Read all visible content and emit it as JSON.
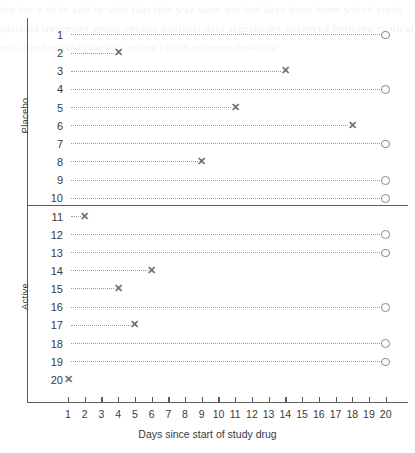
{
  "chart_data": {
    "type": "scatter",
    "title": "",
    "xlabel": "Days since start of study drug",
    "ylabel": "",
    "xlim": [
      0,
      21
    ],
    "xticks": [
      1,
      2,
      3,
      4,
      5,
      6,
      7,
      8,
      9,
      10,
      11,
      12,
      13,
      14,
      15,
      16,
      17,
      18,
      19,
      20
    ],
    "xtick_labels": [
      "1",
      "2",
      "3",
      "4",
      "5",
      "6",
      "7",
      "8",
      "9",
      "10",
      "11",
      "12",
      "13",
      "14",
      "15",
      "16",
      "17",
      "18",
      "19",
      "20"
    ],
    "grid": false,
    "legend": null,
    "groups": [
      {
        "name": "Placebo",
        "subjects": [
          {
            "id": "1",
            "start": 1,
            "end": 20,
            "marker": "circle",
            "has_line": true
          },
          {
            "id": "2",
            "start": 1,
            "end": 4,
            "marker": "cross",
            "has_line": true
          },
          {
            "id": "3",
            "start": 1,
            "end": 14,
            "marker": "cross",
            "has_line": true
          },
          {
            "id": "4",
            "start": 1,
            "end": 20,
            "marker": "circle",
            "has_line": true
          },
          {
            "id": "5",
            "start": 1,
            "end": 11,
            "marker": "cross",
            "has_line": true
          },
          {
            "id": "6",
            "start": 1,
            "end": 18,
            "marker": "cross",
            "has_line": true
          },
          {
            "id": "7",
            "start": 1,
            "end": 20,
            "marker": "circle",
            "has_line": true
          },
          {
            "id": "8",
            "start": 1,
            "end": 9,
            "marker": "cross",
            "has_line": true
          },
          {
            "id": "9",
            "start": 1,
            "end": 20,
            "marker": "circle",
            "has_line": true
          },
          {
            "id": "10",
            "start": 1,
            "end": 20,
            "marker": "circle",
            "has_line": true
          }
        ]
      },
      {
        "name": "Active",
        "subjects": [
          {
            "id": "11",
            "start": 1,
            "end": 2,
            "marker": "cross",
            "has_line": true
          },
          {
            "id": "12",
            "start": 1,
            "end": 20,
            "marker": "circle",
            "has_line": true
          },
          {
            "id": "13",
            "start": 1,
            "end": 20,
            "marker": "circle",
            "has_line": true
          },
          {
            "id": "14",
            "start": 1,
            "end": 6,
            "marker": "cross",
            "has_line": true
          },
          {
            "id": "15",
            "start": 1,
            "end": 4,
            "marker": "cross",
            "has_line": true
          },
          {
            "id": "16",
            "start": 1,
            "end": 20,
            "marker": "circle",
            "has_line": true
          },
          {
            "id": "17",
            "start": 1,
            "end": 5,
            "marker": "cross",
            "has_line": true
          },
          {
            "id": "18",
            "start": 1,
            "end": 20,
            "marker": "circle",
            "has_line": true
          },
          {
            "id": "19",
            "start": 1,
            "end": 20,
            "marker": "circle",
            "has_line": true
          },
          {
            "id": "20",
            "start": 1,
            "end": 1,
            "marker": "cross",
            "has_line": false
          }
        ]
      }
    ],
    "marker_legend": {
      "cross": "discontinued / event",
      "circle": "ongoing at day 20"
    },
    "colors": {
      "axis": "#5b5b5b",
      "dashed_line": "#9a9a9a",
      "cross_marker": "#6e6e6e",
      "circle_marker": "#8a8a8a",
      "text": "#3a3a3a",
      "background": "#ffffff"
    }
  },
  "axis": {
    "x_title": "Days since start of study drug"
  },
  "bleed_text": "the for a of in and to with that this was were not but have been from which study patients treatment group results analysis data significant observed between clinical trial randomised placebo active effect outcome baseline"
}
